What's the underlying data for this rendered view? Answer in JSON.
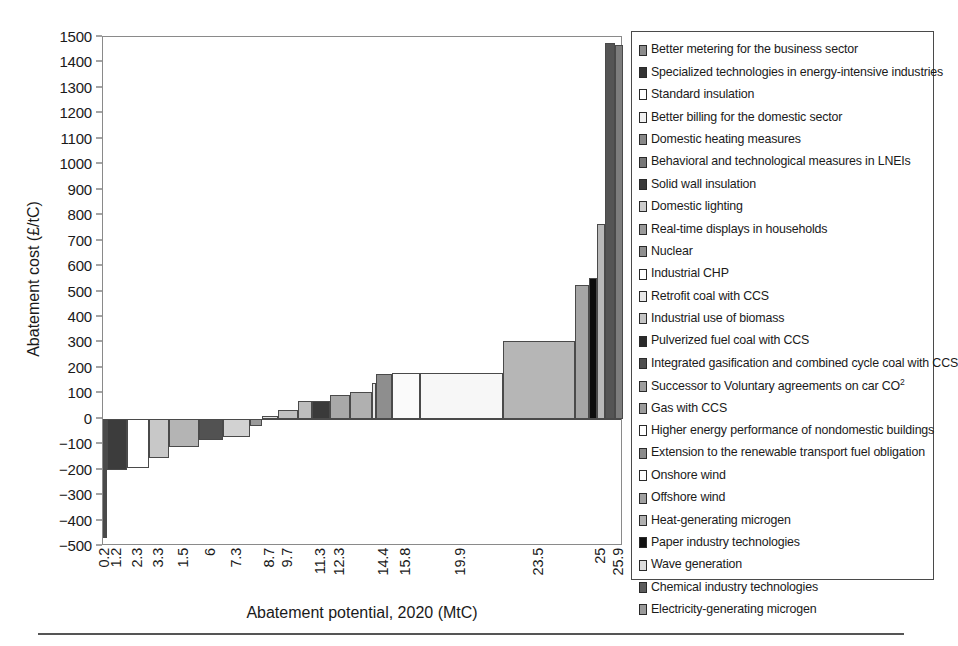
{
  "chart_data": {
    "type": "bar",
    "title": "",
    "xlabel": "Abatement potential, 2020 (MtC)",
    "ylabel": "Abatement cost (£/tC)",
    "ylim": [
      -500,
      1500
    ],
    "ytick_step": 100,
    "grid": false,
    "legend_position": "right",
    "xtick_labels": [
      "0.2",
      "1.2",
      "2.3",
      "3.3",
      "1.5",
      "6",
      "7.3",
      "8.7",
      "9.7",
      "11.3",
      "12.3",
      "14.4",
      "15.8",
      "19.9",
      "23.5",
      "25",
      "25.9"
    ],
    "x_is_cumulative_potential": true,
    "note": "Marginal abatement cost curve: bar width = abatement potential (MtC), bar height = abatement cost (£/tC).",
    "bars": [
      {
        "label": "Better metering for the business sector",
        "x_start": 0.0,
        "x_end": 0.2,
        "value": -470,
        "fill": "#4a4a4a"
      },
      {
        "label": "Specialized technologies in energy-intensive industries",
        "x_start": 0.2,
        "x_end": 1.2,
        "value": -200,
        "fill": "#3c3c3c"
      },
      {
        "label": "Standard insulation",
        "x_start": 1.2,
        "x_end": 2.3,
        "value": -195,
        "fill": "#ffffff"
      },
      {
        "label": "Better billing for the domestic sector",
        "x_start": 2.3,
        "x_end": 3.3,
        "value": -155,
        "fill": "#c8c8c8"
      },
      {
        "label": "Domestic heating measures",
        "x_start": 3.3,
        "x_end": 4.8,
        "value": -110,
        "fill": "#b4b4b4"
      },
      {
        "label": "Behavioral and technological measures in LNEIs",
        "x_start": 4.8,
        "x_end": 6.0,
        "value": -85,
        "fill": "#525252"
      },
      {
        "label": "Solid wall insulation",
        "x_start": 6.0,
        "x_end": 7.3,
        "value": -70,
        "fill": "#d2d2d2"
      },
      {
        "label": "Domestic lighting",
        "x_start": 7.3,
        "x_end": 7.9,
        "value": -30,
        "fill": "#9a9a9a"
      },
      {
        "label": "Real-time displays in households",
        "x_start": 7.9,
        "x_end": 8.7,
        "value": 10,
        "fill": "#e2e2e2"
      },
      {
        "label": "Nuclear",
        "x_start": 8.7,
        "x_end": 9.7,
        "value": 35,
        "fill": "#c0c0c0"
      },
      {
        "label": "Industrial CHP",
        "x_start": 9.7,
        "x_end": 10.4,
        "value": 70,
        "fill": "#bdbdbd"
      },
      {
        "label": "Retrofit coal with CCS",
        "x_start": 10.4,
        "x_end": 11.3,
        "value": 70,
        "fill": "#3a3a3a"
      },
      {
        "label": "Industrial use of biomass",
        "x_start": 11.3,
        "x_end": 12.3,
        "value": 95,
        "fill": "#a8a8a8"
      },
      {
        "label": "Pulverized fuel coal with CCS",
        "x_start": 12.3,
        "x_end": 13.4,
        "value": 105,
        "fill": "#b0b0b0"
      },
      {
        "label": "Integrated gasification and combined cycle coal with CCS",
        "x_start": 13.4,
        "x_end": 13.6,
        "value": 140,
        "fill": "#e8e8e8"
      },
      {
        "label": "Successor to Voluntary agreements on car CO²",
        "x_start": 13.6,
        "x_end": 14.4,
        "value": 175,
        "fill": "#8e8e8e"
      },
      {
        "label": "Gas with CCS",
        "x_start": 14.4,
        "x_end": 15.8,
        "value": 180,
        "fill": "#fafafa"
      },
      {
        "label": "Higher energy performance of nondomestic buildings",
        "x_start": 15.8,
        "x_end": 19.9,
        "value": 180,
        "fill": "#f7f7f7"
      },
      {
        "label": "Extension to the renewable transport fuel obligation",
        "x_start": 19.9,
        "x_end": 23.5,
        "value": 305,
        "fill": "#b6b6b6"
      },
      {
        "label": "Onshore wind",
        "x_start": 23.5,
        "x_end": 24.2,
        "value": 525,
        "fill": "#a5a5a5"
      },
      {
        "label": "Offshore wind",
        "x_start": 24.2,
        "x_end": 24.6,
        "value": 555,
        "fill": "#0d0d0d"
      },
      {
        "label": "Heat-generating microgen",
        "x_start": 24.6,
        "x_end": 25.0,
        "value": 765,
        "fill": "#b9b9b9"
      },
      {
        "label": "Paper industry technologies",
        "x_start": 25.0,
        "x_end": 25.5,
        "value": 1475,
        "fill": "#555555"
      },
      {
        "label": "Electricity-generating microgen",
        "x_start": 25.5,
        "x_end": 25.9,
        "value": 1470,
        "fill": "#7d7d7d"
      }
    ]
  },
  "legend": {
    "items": [
      {
        "label": "Better metering for the business sector",
        "swatch": "#8c8c8c"
      },
      {
        "label": "Specialized technologies in energy-intensive industries",
        "swatch": "#333333"
      },
      {
        "label": "Standard insulation",
        "swatch": "#ffffff"
      },
      {
        "label": "Better billing for the domestic sector",
        "swatch": "#f0f0f0"
      },
      {
        "label": "Domestic heating measures",
        "swatch": "#888888"
      },
      {
        "label": "Behavioral and technological measures in LNEIs",
        "swatch": "#777777"
      },
      {
        "label": "Solid wall insulation",
        "swatch": "#3a3a3a"
      },
      {
        "label": "Domestic lighting",
        "swatch": "#cccccc"
      },
      {
        "label": "Real-time displays in households",
        "swatch": "#9a9a9a"
      },
      {
        "label": "Nuclear",
        "swatch": "#8f8f8f"
      },
      {
        "label": "Industrial CHP",
        "swatch": "#ffffff"
      },
      {
        "label": "Retrofit coal with CCS",
        "swatch": "#e8e8e8"
      },
      {
        "label": "Industrial use of biomass",
        "swatch": "#c4c4c4"
      },
      {
        "label": "Pulverized fuel coal with CCS",
        "swatch": "#2a2a2a"
      },
      {
        "label": "Integrated gasification and combined cycle coal with CCS",
        "swatch": "#4f4f4f"
      },
      {
        "label": "Successor to Voluntary agreements on car CO²",
        "swatch": "#9e9e9e"
      },
      {
        "label": "Gas with CCS",
        "swatch": "#9c9c9c"
      },
      {
        "label": "Higher energy performance of nondomestic buildings",
        "swatch": "#ffffff"
      },
      {
        "label": "Extension to the renewable transport fuel obligation",
        "swatch": "#8a8a8a"
      },
      {
        "label": "Onshore wind",
        "swatch": "#fcfcfc"
      },
      {
        "label": "Offshore wind",
        "swatch": "#a0a0a0"
      },
      {
        "label": "Heat-generating microgen",
        "swatch": "#b0b0b0"
      },
      {
        "label": "Paper industry technologies",
        "swatch": "#111111"
      },
      {
        "label": "Wave generation",
        "swatch": "#dcdcdc"
      },
      {
        "label": "Chemical industry technologies",
        "swatch": "#5c5c5c"
      },
      {
        "label": "Electricity-generating microgen",
        "swatch": "#9a9a9a"
      }
    ]
  }
}
